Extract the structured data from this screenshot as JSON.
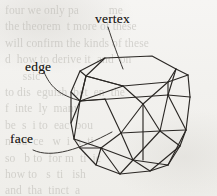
{
  "figure": {
    "kind": "polyhedron-wireframe-diagram",
    "title": "",
    "background_color": "#f4f3f1",
    "ink_color": "#2a2724",
    "labels": [
      {
        "id": "vertex",
        "text": "vertex",
        "x": 95,
        "y": 12
      },
      {
        "id": "edge",
        "text": "edge",
        "x": 25,
        "y": 60
      },
      {
        "id": "face",
        "text": "face",
        "x": 10,
        "y": 132
      }
    ],
    "leader_lines": [
      {
        "id": "vertex-leader",
        "from_label": "vertex",
        "path": "M108,27 C113,43 118,56 123,69"
      },
      {
        "id": "edge-leader",
        "from_label": "edge",
        "path": "M44,72 C50,86 58,95 81,101"
      },
      {
        "id": "face-leader",
        "from_label": "face",
        "path": "M33,150 C52,158 80,149 112,132"
      }
    ],
    "polyhedron": {
      "description": "truncated cube style wireframe solid, 3/4 view",
      "vertices": {
        "t1": [
          105,
          58
        ],
        "t2": [
          152,
          56
        ],
        "t3": [
          176,
          69
        ],
        "t4": [
          168,
          82
        ],
        "t5": [
          123,
          86
        ],
        "t6": [
          86,
          76
        ],
        "u1": [
          80,
          71
        ],
        "u2": [
          71,
          92
        ],
        "u3": [
          80,
          101
        ],
        "m1": [
          131,
          80
        ],
        "m2": [
          168,
          80
        ],
        "m3": [
          188,
          75
        ],
        "m4": [
          190,
          97
        ],
        "m5": [
          186,
          130
        ],
        "r1": [
          180,
          146
        ],
        "r2": [
          168,
          165
        ],
        "r3": [
          150,
          171
        ],
        "b1": [
          120,
          174
        ],
        "b2": [
          96,
          165
        ],
        "b3": [
          80,
          148
        ],
        "l1": [
          71,
          123
        ],
        "l2": [
          74,
          139
        ],
        "c1": [
          143,
          104
        ],
        "c2": [
          121,
          133
        ],
        "c3": [
          160,
          131
        ],
        "c4": [
          133,
          160
        ],
        "c5": [
          101,
          148
        ],
        "c6": [
          168,
          112
        ]
      },
      "edge_count_visible": 44,
      "stroke_width": 1.1
    }
  },
  "ghost_text": "four we only pa          me\nthe theorem  t more of these\nwill confirm the kinds of these\nd  how to derive it  and  on\n      ssic\nto dis  eguish  bet  en  the\nf  inte  ly  many\nbe  s  i to  eac  bou\nn  su  ce   w  i  a  ti\nso   b to  for m  ti  ic\nhow to   s  ti   ish\nand  tha  tinct  a\n  l  g  t  oli  obta\nvi  solid  to  a"
}
